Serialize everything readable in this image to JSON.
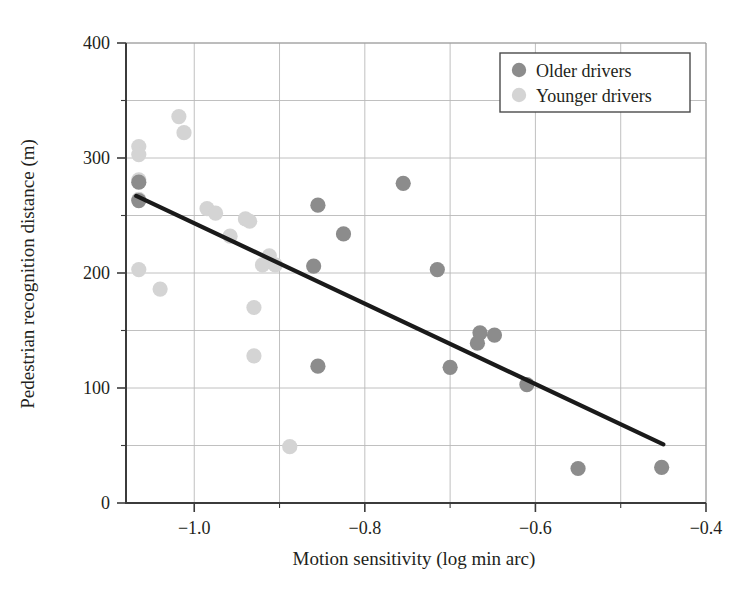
{
  "chart_data": {
    "type": "scatter",
    "title": "",
    "xlabel": "Motion sensitivity (log min arc)",
    "ylabel": "Pedestrian recognition distance (m)",
    "xlim": [
      -1.08,
      -0.4
    ],
    "ylim": [
      0,
      400
    ],
    "xticks": [
      -1.0,
      -0.8,
      -0.6,
      -0.4
    ],
    "xtick_labels": [
      "−1.0",
      "−0.8",
      "−0.6",
      "−0.4"
    ],
    "yticks": [
      0,
      100,
      200,
      300,
      400
    ],
    "ytick_labels": [
      "0",
      "100",
      "200",
      "300",
      "400"
    ],
    "grid": true,
    "legend_position": "top-right",
    "colors": {
      "older": "#8c8c8c",
      "younger": "#d4d4d4",
      "trend_line": "#1a1a1a",
      "grid": "#b9b9b9",
      "axis": "#3b3b3b",
      "text": "#231f20"
    },
    "series": [
      {
        "name": "Older drivers",
        "marker": "circle",
        "color": "#8c8c8c",
        "points": [
          [
            -1.065,
            279
          ],
          [
            -1.065,
            263
          ],
          [
            -0.855,
            259
          ],
          [
            -0.825,
            234
          ],
          [
            -0.755,
            278
          ],
          [
            -0.715,
            203
          ],
          [
            -0.86,
            206
          ],
          [
            -0.7,
            118
          ],
          [
            -0.855,
            119
          ],
          [
            -0.665,
            148
          ],
          [
            -0.668,
            139
          ],
          [
            -0.648,
            146
          ],
          [
            -0.61,
            103
          ],
          [
            -0.55,
            30
          ],
          [
            -0.452,
            31
          ]
        ]
      },
      {
        "name": "Younger drivers",
        "marker": "circle",
        "color": "#d4d4d4",
        "points": [
          [
            -1.065,
            310
          ],
          [
            -1.065,
            303
          ],
          [
            -1.065,
            281
          ],
          [
            -1.065,
            264
          ],
          [
            -1.065,
            203
          ],
          [
            -1.018,
            336
          ],
          [
            -1.012,
            322
          ],
          [
            -1.04,
            186
          ],
          [
            -0.985,
            256
          ],
          [
            -0.975,
            252
          ],
          [
            -0.958,
            232
          ],
          [
            -0.94,
            247
          ],
          [
            -0.935,
            245
          ],
          [
            -0.93,
            170
          ],
          [
            -0.912,
            215
          ],
          [
            -0.92,
            207
          ],
          [
            -0.905,
            207
          ],
          [
            -0.93,
            128
          ],
          [
            -0.888,
            49
          ]
        ]
      }
    ],
    "trend_line": {
      "x0": -1.068,
      "y0": 267,
      "x1": -0.45,
      "y1": 51
    }
  },
  "legend": {
    "items": [
      {
        "label": "Older drivers",
        "color": "#8c8c8c"
      },
      {
        "label": "Younger drivers",
        "color": "#d4d4d4"
      }
    ]
  }
}
